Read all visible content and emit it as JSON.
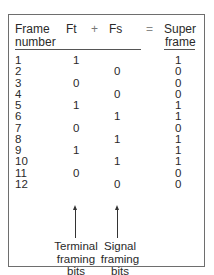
{
  "table": {
    "headers": {
      "frame_number_line1": "Frame",
      "frame_number_line2": "number",
      "ft": "Ft",
      "plus": "+",
      "fs": "Fs",
      "equals": "=",
      "superframe_line1": "Super",
      "superframe_line2": "frame"
    },
    "rows": [
      {
        "frame": "1",
        "ft": "1",
        "fs": "",
        "super": "1"
      },
      {
        "frame": "2",
        "ft": "",
        "fs": "0",
        "super": "0"
      },
      {
        "frame": "3",
        "ft": "0",
        "fs": "",
        "super": "0"
      },
      {
        "frame": "4",
        "ft": "",
        "fs": "0",
        "super": "0"
      },
      {
        "frame": "5",
        "ft": "1",
        "fs": "",
        "super": "1"
      },
      {
        "frame": "6",
        "ft": "",
        "fs": "1",
        "super": "1"
      },
      {
        "frame": "7",
        "ft": "0",
        "fs": "",
        "super": "0"
      },
      {
        "frame": "8",
        "ft": "",
        "fs": "1",
        "super": "1"
      },
      {
        "frame": "9",
        "ft": "1",
        "fs": "",
        "super": "1"
      },
      {
        "frame": "10",
        "ft": "",
        "fs": "1",
        "super": "1"
      },
      {
        "frame": "11",
        "ft": "0",
        "fs": "",
        "super": "0"
      },
      {
        "frame": "12",
        "ft": "",
        "fs": "0",
        "super": "0"
      }
    ]
  },
  "annotations": {
    "terminal": {
      "line1": "Terminal",
      "line2": "framing",
      "line3": "bits",
      "icon": "arrow-up-icon"
    },
    "signal": {
      "line1": "Signal",
      "line2": "framing",
      "line3": "bits",
      "icon": "arrow-up-icon"
    }
  },
  "colors": {
    "text": "#2a2a2a",
    "border": "#6e6e6e",
    "background": "#ffffff"
  }
}
